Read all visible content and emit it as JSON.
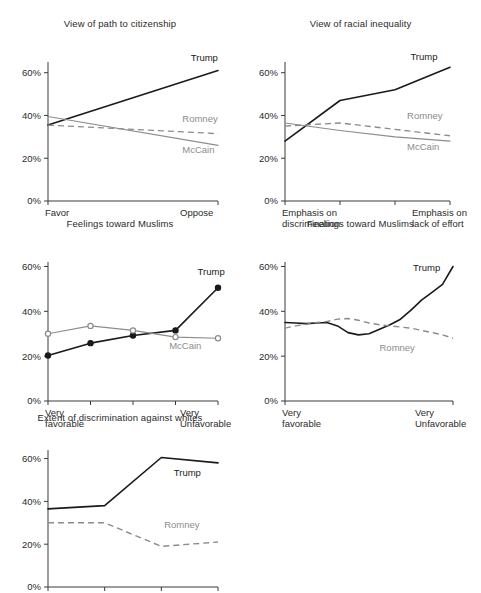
{
  "figure": {
    "width": 481,
    "height": 593,
    "background": "#ffffff",
    "colors": {
      "trump": "#1a1a1a",
      "mccain": "#8c8c8c",
      "romney": "#8c8c8c",
      "axis": "#3a3a3a",
      "text": "#2b2b2b"
    }
  },
  "chart_data": [
    {
      "id": "view-of-path-to-citizenship",
      "type": "line",
      "title": "View of path to citizenship",
      "xlabel": "",
      "ylabel": "",
      "ylim": [
        0,
        65
      ],
      "yticks": [
        0,
        20,
        40,
        60
      ],
      "ytick_labels": [
        "0%",
        "20%",
        "40%",
        "60%"
      ],
      "grid": false,
      "legend": "inline-labels",
      "x": [
        0,
        1
      ],
      "xtick_labels": [
        "Favor",
        "Oppose"
      ],
      "xtick_lines": [
        [
          "Favor"
        ],
        [
          "Oppose"
        ]
      ],
      "series": [
        {
          "name": "Trump",
          "style": "solid",
          "color": "#1a1a1a",
          "values": [
            35.5,
            61.0
          ],
          "label_x": 0.84,
          "label_y": 65.5,
          "anchor": "start"
        },
        {
          "name": "Romney",
          "style": "dashed",
          "color": "#8c8c8c",
          "values": [
            35.5,
            31.5
          ],
          "label_x": 0.79,
          "label_y": 37.0,
          "anchor": "start"
        },
        {
          "name": "McCain",
          "style": "thin",
          "color": "#8c8c8c",
          "values": [
            39.5,
            26.0
          ],
          "label_x": 0.79,
          "label_y": 22.5,
          "anchor": "start"
        }
      ]
    },
    {
      "id": "view-of-racial-inequality",
      "type": "line",
      "title": "View of racial inequality",
      "xlabel": "",
      "ylabel": "",
      "ylim": [
        0,
        65
      ],
      "yticks": [
        0,
        20,
        40,
        60
      ],
      "ytick_labels": [
        "0%",
        "20%",
        "40%",
        "60%"
      ],
      "grid": false,
      "legend": "inline-labels",
      "x": [
        0,
        1,
        2,
        3
      ],
      "xtick_labels": [
        "Emphasis on discrimination",
        "",
        "",
        "Emphasis on lack of effort"
      ],
      "xtick_lines": [
        [
          "Emphasis on",
          "discrimination"
        ],
        [],
        [],
        [
          "Emphasis on",
          "lack of effort"
        ]
      ],
      "series": [
        {
          "name": "Trump",
          "style": "solid",
          "color": "#1a1a1a",
          "values": [
            28.0,
            47.0,
            52.0,
            62.5
          ],
          "label_x": 2.28,
          "label_y": 66.0,
          "anchor": "start"
        },
        {
          "name": "Romney",
          "style": "dashed",
          "color": "#8c8c8c",
          "values": [
            35.0,
            36.5,
            33.5,
            30.5
          ],
          "label_x": 2.22,
          "label_y": 38.5,
          "anchor": "start"
        },
        {
          "name": "McCain",
          "style": "thin",
          "color": "#8c8c8c",
          "values": [
            36.5,
            33.0,
            30.0,
            28.0
          ],
          "label_x": 2.22,
          "label_y": 24.0,
          "anchor": "start"
        }
      ]
    },
    {
      "id": "feelings-toward-muslims-markers",
      "type": "line",
      "title": "Feelings toward Muslims",
      "xlabel": "",
      "ylabel": "",
      "ylim": [
        0,
        62
      ],
      "yticks": [
        0,
        20,
        40,
        60
      ],
      "ytick_labels": [
        "0%",
        "20%",
        "40%",
        "60%"
      ],
      "grid": false,
      "legend": "inline-labels",
      "markers": true,
      "x": [
        0,
        1,
        2,
        3,
        4
      ],
      "xtick_labels": [
        "Very favorable",
        "",
        "",
        "",
        "Very Unfavorable"
      ],
      "xtick_lines": [
        [
          "Very",
          "favorable"
        ],
        [],
        [],
        [],
        [
          "Very",
          "Unfavorable"
        ]
      ],
      "series": [
        {
          "name": "Trump",
          "style": "solid",
          "color": "#1a1a1a",
          "marker": "filled",
          "values": [
            20.3,
            25.8,
            29.2,
            31.5,
            50.5
          ],
          "label_x": 3.52,
          "label_y": 56.0,
          "anchor": "start"
        },
        {
          "name": "McCain",
          "style": "thin",
          "color": "#8c8c8c",
          "marker": "open",
          "values": [
            30.0,
            33.5,
            31.5,
            28.5,
            28.0
          ],
          "label_x": 2.85,
          "label_y": 23.0,
          "anchor": "start"
        }
      ]
    },
    {
      "id": "feelings-toward-muslims-smooth",
      "type": "line",
      "title": "Feelings toward Muslims",
      "xlabel": "",
      "ylabel": "",
      "ylim": [
        0,
        62
      ],
      "yticks": [
        0,
        20,
        40,
        60
      ],
      "ytick_labels": [
        "0%",
        "20%",
        "40%",
        "60%"
      ],
      "grid": false,
      "legend": "inline-labels",
      "x": [
        0,
        1,
        2,
        3,
        4,
        5,
        6,
        7,
        8,
        9,
        10,
        11,
        12,
        13,
        14,
        15,
        16
      ],
      "xtick_labels": [
        "Very favorable",
        "Very Unfavorable"
      ],
      "xtick_lines": [
        [
          "Very",
          "favorable"
        ],
        [
          "Very",
          "Unfavorable"
        ]
      ],
      "xtick_at": [
        0,
        16
      ],
      "series": [
        {
          "name": "Trump",
          "style": "solid",
          "color": "#1a1a1a",
          "values": [
            35.0,
            34.8,
            34.5,
            34.8,
            35.0,
            33.5,
            30.5,
            29.5,
            30.0,
            32.0,
            34.0,
            36.5,
            40.5,
            45.0,
            48.5,
            52.0,
            60.0
          ],
          "label_x": 12.2,
          "label_y": 58.0,
          "anchor": "start"
        },
        {
          "name": "Romney",
          "style": "dashed",
          "color": "#8c8c8c",
          "values": [
            32.5,
            33.5,
            34.2,
            35.0,
            35.5,
            36.5,
            36.8,
            36.0,
            34.8,
            34.0,
            33.5,
            33.0,
            32.5,
            31.5,
            30.5,
            29.5,
            28.0
          ],
          "label_x": 9.0,
          "label_y": 22.5,
          "anchor": "start"
        }
      ]
    },
    {
      "id": "extent-of-discrimination-against-whites",
      "type": "line",
      "title": "Extent of discrimination against whites",
      "xlabel": "",
      "ylabel": "",
      "ylim": [
        0,
        64
      ],
      "yticks": [
        0,
        20,
        40,
        60
      ],
      "ytick_labels": [
        "0%",
        "20%",
        "40%",
        "60%"
      ],
      "grid": false,
      "legend": "inline-labels",
      "x": [
        0,
        1,
        2,
        3
      ],
      "xtick_labels": [
        "None at all",
        "",
        "",
        "A great deal"
      ],
      "xtick_lines": [
        [
          "None",
          "at all"
        ],
        [],
        [],
        [
          "A great",
          "deal"
        ]
      ],
      "series": [
        {
          "name": "Trump",
          "style": "solid",
          "color": "#1a1a1a",
          "values": [
            36.5,
            38.0,
            60.5,
            58.0
          ],
          "label_x": 2.22,
          "label_y": 52.0,
          "anchor": "start"
        },
        {
          "name": "Romney",
          "style": "dashed",
          "color": "#8c8c8c",
          "values": [
            30.0,
            30.0,
            19.0,
            21.0
          ],
          "label_x": 2.05,
          "label_y": 27.5,
          "anchor": "start"
        }
      ]
    }
  ],
  "panels": [
    {
      "chart": 0,
      "left": 0,
      "top": 18,
      "width": 240,
      "height": 190,
      "plot": {
        "x": 48,
        "y": 44,
        "w": 170,
        "h": 139
      }
    },
    {
      "chart": 1,
      "left": 240,
      "top": 18,
      "width": 241,
      "height": 190,
      "plot": {
        "x": 45,
        "y": 44,
        "w": 165,
        "h": 139
      }
    },
    {
      "chart": 2,
      "left": 0,
      "top": 218,
      "width": 240,
      "height": 190,
      "plot": {
        "x": 48,
        "y": 44,
        "w": 170,
        "h": 139
      }
    },
    {
      "chart": 3,
      "left": 240,
      "top": 218,
      "width": 241,
      "height": 190,
      "plot": {
        "x": 45,
        "y": 44,
        "w": 168,
        "h": 139
      }
    },
    {
      "chart": 4,
      "left": 0,
      "top": 412,
      "width": 240,
      "height": 181,
      "plot": {
        "x": 48,
        "y": 38,
        "w": 170,
        "h": 137
      }
    }
  ]
}
